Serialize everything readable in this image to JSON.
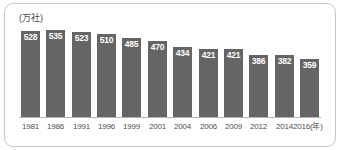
{
  "chart_data": {
    "type": "bar",
    "title": "",
    "subtitle": "",
    "xlabel": "年",
    "ylabel": "万社",
    "unit_label": "(万社)",
    "year_axis_suffix": "(年)",
    "categories": [
      "1981",
      "1986",
      "1991",
      "1996",
      "1999",
      "2001",
      "2004",
      "2006",
      "2009",
      "2012",
      "2014",
      "2016"
    ],
    "values": [
      528,
      535,
      523,
      510,
      485,
      470,
      434,
      421,
      421,
      386,
      382,
      359
    ],
    "ylim": [
      0,
      560
    ],
    "grid": false,
    "legend": false,
    "bar_color": "#656565",
    "value_label_color": "#ffffff",
    "axis_color": "#b4b4b4",
    "frame_color": "#c8c8c8"
  }
}
